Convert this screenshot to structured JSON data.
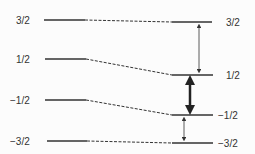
{
  "diagram": {
    "left_labels": [
      "3/2",
      "1/2",
      "−1/2",
      "−3/2"
    ],
    "right_labels": [
      "3/2",
      "1/2",
      "−1/2",
      "−3/2"
    ],
    "left_levels_y": [
      20,
      59,
      100,
      141
    ],
    "right_levels_y": [
      22,
      75,
      115,
      143
    ],
    "arrows": [
      {
        "from": "3/2",
        "to": "1/2",
        "weight": "thin"
      },
      {
        "from": "1/2",
        "to": "−1/2",
        "weight": "bold"
      },
      {
        "from": "−1/2",
        "to": "−3/2",
        "weight": "thin"
      }
    ],
    "color": "#333333"
  }
}
